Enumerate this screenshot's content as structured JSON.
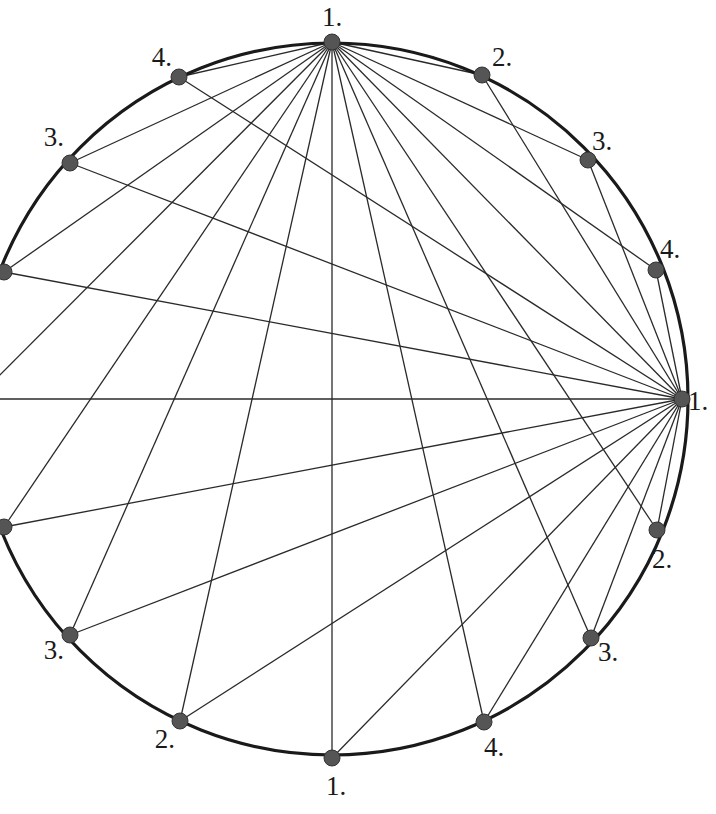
{
  "diagram": {
    "title": "",
    "colors": {
      "circle": "#1a1a1a",
      "chord": "#2a2a2a",
      "node": "#555555",
      "label": "#1a1a1a",
      "background": "#ffffff"
    },
    "circle": {
      "cx": 332,
      "cy": 399,
      "r": 356
    },
    "hubs": [
      "top",
      "right"
    ],
    "nodes": [
      {
        "id": "top",
        "label": "1.",
        "x": 332,
        "y": 42,
        "lx": 332,
        "ly": 26,
        "anchor": "middle"
      },
      {
        "id": "upper-right-1",
        "label": "2.",
        "x": 482,
        "y": 75,
        "lx": 492,
        "ly": 66,
        "anchor": "start"
      },
      {
        "id": "upper-right-2",
        "label": "3.",
        "x": 588,
        "y": 160,
        "lx": 592,
        "ly": 150,
        "anchor": "start"
      },
      {
        "id": "upper-right-3",
        "label": "4.",
        "x": 656,
        "y": 270,
        "lx": 660,
        "ly": 258,
        "anchor": "start"
      },
      {
        "id": "right",
        "label": "1.",
        "x": 682,
        "y": 399,
        "lx": 688,
        "ly": 410,
        "anchor": "start"
      },
      {
        "id": "lower-right-1",
        "label": "2.",
        "x": 657,
        "y": 530,
        "lx": 652,
        "ly": 568,
        "anchor": "start"
      },
      {
        "id": "lower-right-2",
        "label": "3.",
        "x": 591,
        "y": 638,
        "lx": 598,
        "ly": 661,
        "anchor": "start"
      },
      {
        "id": "lower-right-3",
        "label": "4.",
        "x": 484,
        "y": 722,
        "lx": 484,
        "ly": 756,
        "anchor": "start"
      },
      {
        "id": "bottom",
        "label": "1.",
        "x": 332,
        "y": 758,
        "lx": 336,
        "ly": 795,
        "anchor": "middle"
      },
      {
        "id": "lower-left-1",
        "label": "2.",
        "x": 180,
        "y": 721,
        "lx": 175,
        "ly": 748,
        "anchor": "end"
      },
      {
        "id": "lower-left-2",
        "label": "3.",
        "x": 70,
        "y": 635,
        "lx": 64,
        "ly": 659,
        "anchor": "end"
      },
      {
        "id": "lower-left-3",
        "label": "",
        "x": 4,
        "y": 527,
        "lx": 0,
        "ly": 0,
        "anchor": "end"
      },
      {
        "id": "left",
        "label": "",
        "x": -24,
        "y": 399,
        "lx": 0,
        "ly": 0,
        "anchor": "end"
      },
      {
        "id": "upper-left-3",
        "label": "",
        "x": 4,
        "y": 272,
        "lx": 0,
        "ly": 0,
        "anchor": "end"
      },
      {
        "id": "upper-left-2",
        "label": "3.",
        "x": 70,
        "y": 163,
        "lx": 64,
        "ly": 146,
        "anchor": "end"
      },
      {
        "id": "upper-left-1",
        "label": "4.",
        "x": 179,
        "y": 77,
        "lx": 172,
        "ly": 66,
        "anchor": "end"
      }
    ]
  }
}
